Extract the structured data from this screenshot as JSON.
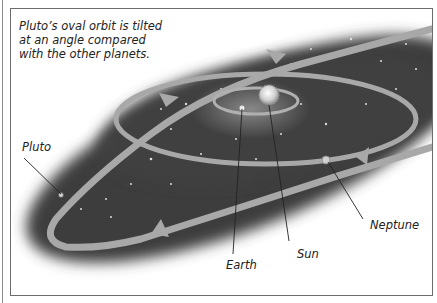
{
  "diagram": {
    "caption": "Pluto’s oval orbit is tilted at an angle compared with the other planets.",
    "caption_lines": [
      "Pluto’s oval orbit is tilted",
      "at an angle compared",
      "with the other planets."
    ],
    "labels": {
      "pluto": "Pluto",
      "earth": "Earth",
      "sun": "Sun",
      "neptune": "Neptune"
    },
    "colors": {
      "space": "#3e3e3e",
      "orbit": "#a8a8a8",
      "frame": "#6c6c6c",
      "text": "#222222"
    }
  }
}
